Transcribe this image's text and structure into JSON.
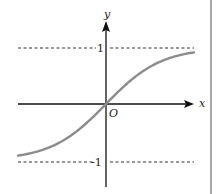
{
  "chart_data": {
    "type": "line",
    "title": "",
    "xlabel": "x",
    "ylabel": "y",
    "origin_label": "O",
    "function_shape": "sigmoid (tanh-like), passes through origin, horizontal asymptotes y=1 and y=-1",
    "asymptotes": [
      {
        "y": 1,
        "label": "1",
        "style": "dashed"
      },
      {
        "y": -1,
        "label": "-1",
        "style": "dashed"
      }
    ],
    "ylim": [
      -1.2,
      1.45
    ],
    "grid": false,
    "legend": null,
    "series": [
      {
        "name": "curve",
        "color": "#8c8c8c",
        "x": [
          -1.6,
          -1.2,
          -0.8,
          -0.4,
          0,
          0.4,
          0.8,
          1.2,
          1.6
        ],
        "y": [
          -0.87,
          -0.74,
          -0.55,
          -0.31,
          0,
          0.31,
          0.55,
          0.74,
          0.87
        ]
      }
    ]
  },
  "labels": {
    "x_axis": "x",
    "y_axis": "y",
    "origin": "O",
    "upper_asymptote": "1",
    "lower_asymptote": "-1"
  },
  "colors": {
    "axis": "#111111",
    "curve": "#8c8c8c",
    "dashed": "#333333",
    "border": "#a9a9a9"
  }
}
